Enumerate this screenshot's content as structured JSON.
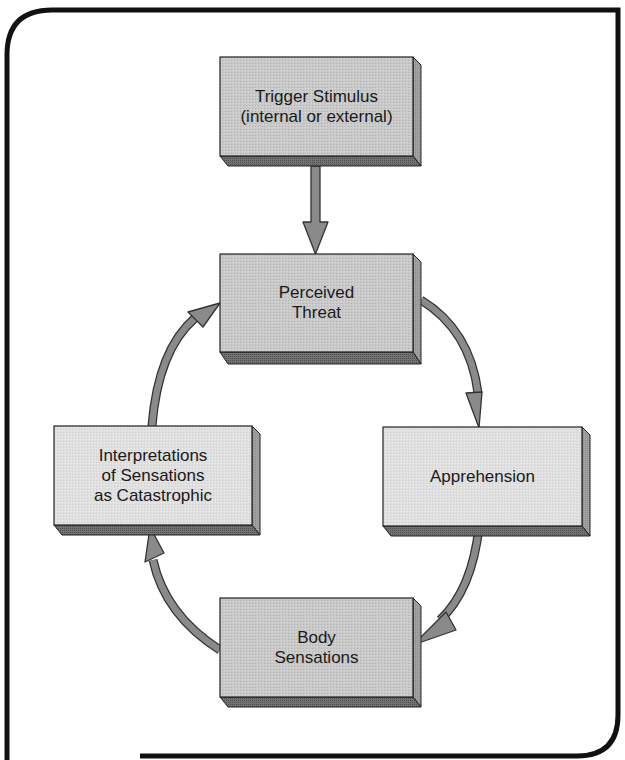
{
  "diagram": {
    "type": "flow-cycle",
    "colors": {
      "frame": "#111111",
      "box_front_dark": "#c4c4c4",
      "box_front_light": "#dedede",
      "box_side": "#9a9a9a",
      "box_bottom": "#6f6f6f",
      "arrow_fill": "#8a8a8a",
      "arrow_stroke": "#333333"
    },
    "nodes": [
      {
        "id": "trigger",
        "label": "Trigger Stimulus\n(internal or external)"
      },
      {
        "id": "threat",
        "label": "Perceived\nThreat"
      },
      {
        "id": "apprehension",
        "label": "Apprehension"
      },
      {
        "id": "body",
        "label": "Body\nSensations"
      },
      {
        "id": "interpretations",
        "label": "Interpretations\nof Sensations\nas Catastrophic"
      }
    ],
    "edges": [
      {
        "from": "trigger",
        "to": "threat"
      },
      {
        "from": "threat",
        "to": "apprehension"
      },
      {
        "from": "apprehension",
        "to": "body"
      },
      {
        "from": "body",
        "to": "interpretations"
      },
      {
        "from": "interpretations",
        "to": "threat"
      }
    ]
  }
}
